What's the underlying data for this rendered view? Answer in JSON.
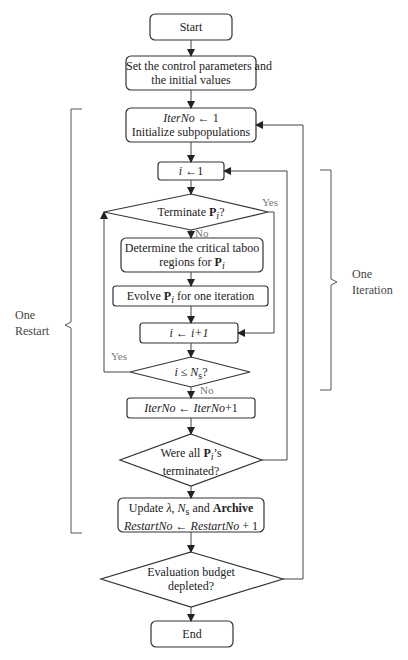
{
  "diagram": {
    "type": "flowchart",
    "nodes": {
      "start": "Start",
      "set_params": [
        "Set the control parameters and",
        "the initial values"
      ],
      "iterno_init": {
        "var": "IterNo",
        "arrow": "←",
        "val": "1",
        "line2": "Initialize subpopulations"
      },
      "i_init": {
        "var": "i",
        "arrow": "←",
        "val": "1"
      },
      "terminate": {
        "pre": "Terminate ",
        "sym": "P",
        "sub": "i",
        "post": "?"
      },
      "taboo": {
        "line1": "Determine the critical taboo",
        "pre": "regions for ",
        "sym": "P",
        "sub": "i"
      },
      "evolve": {
        "pre": "Evolve ",
        "sym": "P",
        "sub": "i",
        "post": " for one iteration"
      },
      "i_inc": {
        "var": "i",
        "arrow": "←",
        "val": "i+1"
      },
      "i_le_ns": {
        "var": "i",
        "op": " ≤ ",
        "sym": "N",
        "sub": "s",
        "post": "?"
      },
      "iterno_inc": {
        "var": "IterNo",
        "arrow": "←",
        "val": "IterNo",
        "post": "+1"
      },
      "all_terminated": {
        "pre": "Were all ",
        "sym": "P",
        "sub": "i",
        "post": "’s",
        "line2": "terminated?"
      },
      "update": {
        "pre": "Update ",
        "lam": "λ",
        "mid": ", ",
        "sym": "N",
        "sub": "s",
        "and": " and ",
        "archive": "Archive",
        "var": "RestartNo",
        "arrow": "←",
        "val": "RestartNo",
        "post": " + 1"
      },
      "budget": [
        "Evaluation budget",
        "depleted?"
      ],
      "end": "End"
    },
    "edge_labels": {
      "terminate_yes": "Yes",
      "terminate_no": "No",
      "ile_yes": "Yes",
      "ile_no": "No"
    },
    "brackets": {
      "left": [
        "One",
        "Restart"
      ],
      "right": [
        "One",
        "Iteration"
      ]
    }
  }
}
